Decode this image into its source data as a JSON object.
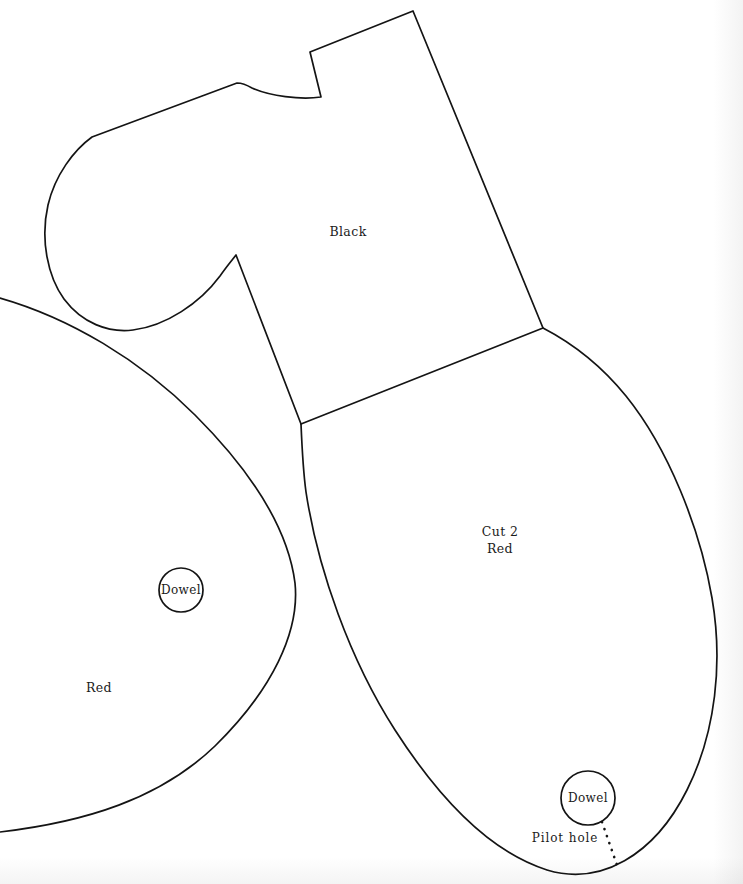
{
  "document": {
    "title": "Woodworking Cut Pattern Template",
    "background_color": "#fefefe",
    "line_color": "#141414",
    "width": 743,
    "height": 884
  },
  "labels": {
    "black_piece": "Black",
    "main_piece_cut": "Cut 2",
    "main_piece_color": "Red",
    "left_piece_color": "Red",
    "dowel_left": "Dowel",
    "dowel_right": "Dowel",
    "pilot_hole": "Pilot hole"
  },
  "pieces": [
    {
      "name": "black-piece",
      "label": "Black",
      "label_x": 348,
      "label_y": 231
    },
    {
      "name": "main-red-piece",
      "label_line_1": "Cut 2",
      "label_line_2": "Red",
      "label_x": 500,
      "label_y": 540
    },
    {
      "name": "left-red-piece",
      "label": "Red",
      "label_x": 99,
      "label_y": 687
    }
  ],
  "markers": [
    {
      "name": "dowel-left",
      "label": "Dowel",
      "cx": 181,
      "cy": 590,
      "r": 22
    },
    {
      "name": "dowel-right",
      "label": "Dowel",
      "cx": 588,
      "cy": 798,
      "r": 27
    },
    {
      "name": "pilot-hole",
      "label": "Pilot hole",
      "label_x": 565,
      "label_y": 838,
      "leader_from_x": 602,
      "leader_from_y": 822,
      "leader_to_x": 618,
      "leader_to_y": 868
    }
  ],
  "geometry": {
    "black_outline": "M 413 11 L 310 52 L 321 97 C 300 100 270 96 252 88 C 247 85 241 83 237 83 L 92 137 C 74 150 55 175 48 205 C 40 240 48 277 64 299 C 82 323 108 333 133 330 C 166 326 200 303 220 276 C 227 266 233 259 236 255 L 301 424 L 543 328 Z",
    "black_right_edge": "M 413 11 L 543 328",
    "left_red_outline": "M 0 298 C 70 318 140 360 195 415 C 250 470 288 528 295 583 C 300 632 272 690 215 746 C 160 799 85 822 0 832",
    "main_red_outline": "M 301 424 C 302 448 303 470 306 492 C 318 570 350 660 395 730 C 440 800 490 852 547 870 C 600 886 654 856 687 790 C 716 732 723 662 712 598 C 700 528 668 448 626 396 C 600 364 570 342 543 328",
    "junctions": [
      {
        "name": "top-vertex",
        "x": 413,
        "y": 11
      },
      {
        "name": "notch-upper",
        "x": 310,
        "y": 52
      },
      {
        "name": "notch-lower",
        "x": 321,
        "y": 97
      },
      {
        "name": "hook-shoulder",
        "x": 237,
        "y": 83
      },
      {
        "name": "hook-left-turn",
        "x": 92,
        "y": 137
      },
      {
        "name": "hook-cusp",
        "x": 236,
        "y": 255
      },
      {
        "name": "center-junction",
        "x": 301,
        "y": 424
      },
      {
        "name": "right-junction",
        "x": 543,
        "y": 328
      }
    ]
  }
}
